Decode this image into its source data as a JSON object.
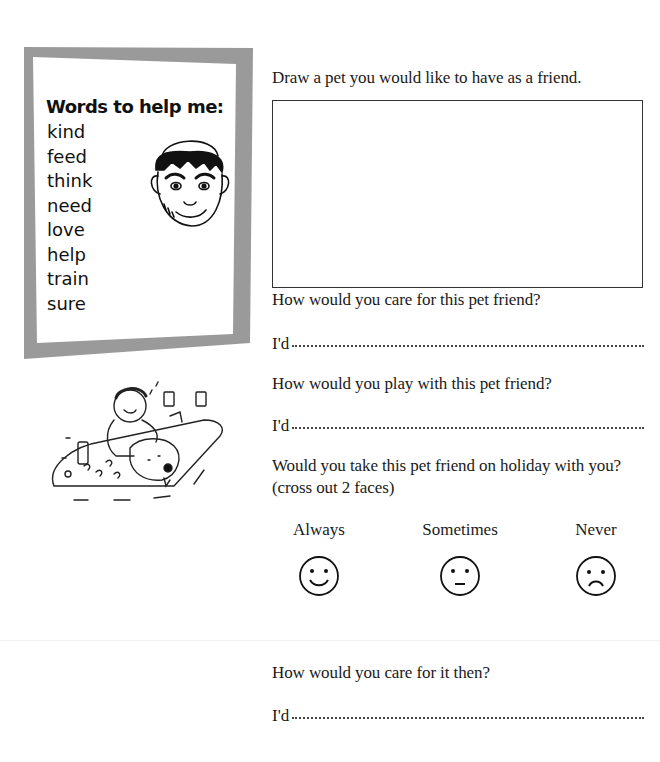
{
  "page": {
    "title": "Pet friends"
  },
  "sidebar": {
    "heading": "Words to help me:",
    "words": [
      "kind",
      "feed",
      "think",
      "need",
      "love",
      "help",
      "train",
      "sure"
    ],
    "frame_color": "#9a9a9a"
  },
  "illustrations": {
    "boy_face": "boy-with-cap-illustration",
    "dog_wash": "boy-washing-dog-illustration"
  },
  "questions": {
    "draw_prompt": "Draw a pet you would like to have as a friend.",
    "care_prompt": "How would you care for this pet friend?",
    "care_answer_lead": "I'd",
    "play_prompt": "How would you play with this pet friend?",
    "play_answer_lead": "I'd",
    "holiday_prompt": "Would you take this pet friend on holiday with you?",
    "holiday_instruction": "(cross out 2 faces)",
    "faces": [
      {
        "label": "Always",
        "icon": "happy-face"
      },
      {
        "label": "Sometimes",
        "icon": "neutral-face"
      },
      {
        "label": "Never",
        "icon": "sad-face"
      }
    ],
    "then_prompt": "How would you care for it then?",
    "then_answer_lead": "I'd"
  }
}
